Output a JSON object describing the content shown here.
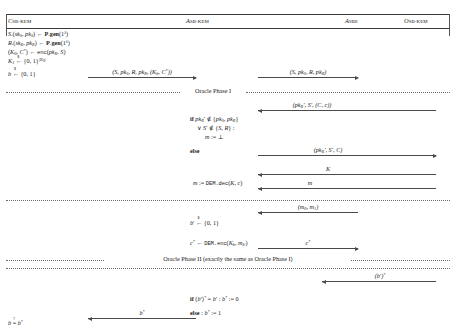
{
  "figure": {
    "kind": "cryptographic-protocol-sequence-diagram",
    "columns": [
      {
        "id": "challenger",
        "symbol": "C",
        "subscript": "SB-KEM",
        "x_center": 30
      },
      {
        "id": "adversary-kem",
        "symbol": "A",
        "subscript": "SB-KEM",
        "x_center": 202
      },
      {
        "id": "adversary-sbe",
        "symbol": "A",
        "subscript": "SBE",
        "x_center": 355
      },
      {
        "id": "oracle",
        "symbol": "O",
        "subscript": "SB-KEM",
        "x_center": 420
      }
    ]
  },
  "setup": {
    "lines": [
      "S.(sk_S, pk_S) <- P.gen(1^lambda)",
      "R.(sk_R, pk_R) <- P.gen(1^lambda)",
      "(K_0, C*) <- enc(pk_R, S)",
      "K_1 <-$ {0,1}^{|K_0|}",
      "b <-$ {0,1}"
    ]
  },
  "messages": {
    "m1": "(S, pk_S, R, pk_R, (K_b, C*))",
    "m2": "(S, pk_S, R, pk_R)",
    "m3": "(pk_R, S', (C, c))",
    "m4": "(pk_R, S', C)",
    "m5": "K",
    "m6": "m",
    "m7": "(m_0, m_1)",
    "m8": "c*",
    "m9": "(b')*",
    "m10": "b*"
  },
  "phases": {
    "phase1": "Oracle Phase I",
    "phase2": "Oracle Phase II (exactly the same as Oracle Phase I)"
  },
  "oracle_logic": {
    "if_line1": "if pk_R' ∉ {pk_S, pk_R}",
    "if_line2": "∨ S' ∉ {S, R} :",
    "if_body": "m := ⊥",
    "else": "else",
    "dec_line": "m := DEM.dec(K, c)"
  },
  "adversary_sbe": {
    "bit_choice": "b' <-$ {0,1}",
    "encrypt": "c* <- DEM.enc(K_b, m_b')"
  },
  "final": {
    "check_line": "if (b')* = b' : b* := 0",
    "else_line": "else : b* := 1",
    "output": "b =? b*"
  },
  "colors": {
    "rule": "#3a3a3a",
    "arrow": "#4a4a4a",
    "dotted": "#6a6a6a",
    "text": "#1b1b1b"
  }
}
